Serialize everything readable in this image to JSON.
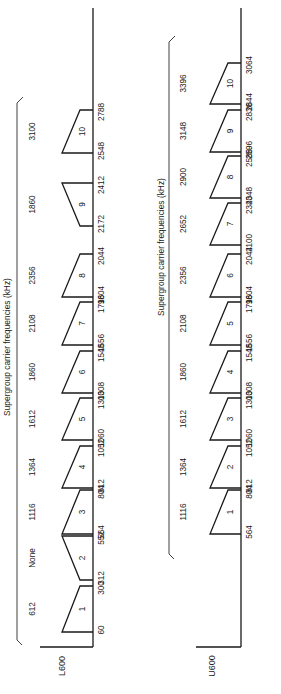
{
  "title": "Supergroup carrier frequencies (kHz)",
  "panels": [
    {
      "name": "L600",
      "label": "L600",
      "title": "Supergroup carrier frequencies (kHz)",
      "supergroups": [
        {
          "n": "1",
          "low": 60,
          "high": 300,
          "carrier": "612",
          "inverted": false
        },
        {
          "n": "2",
          "low": 312,
          "high": 552,
          "carrier": "None",
          "inverted": true
        },
        {
          "n": "3",
          "low": 564,
          "high": 804,
          "carrier": "1116",
          "inverted": false
        },
        {
          "n": "4",
          "low": 812,
          "high": 1052,
          "carrier": "1364",
          "inverted": false
        },
        {
          "n": "5",
          "low": 1060,
          "high": 1300,
          "carrier": "1612",
          "inverted": false
        },
        {
          "n": "6",
          "low": 1308,
          "high": 1548,
          "carrier": "1860",
          "inverted": false
        },
        {
          "n": "7",
          "low": 1556,
          "high": 1796,
          "carrier": "2108",
          "inverted": false
        },
        {
          "n": "8",
          "low": 1804,
          "high": 2044,
          "carrier": "2356",
          "inverted": false
        },
        {
          "n": "9",
          "low": 2172,
          "high": 2412,
          "carrier": "1860",
          "inverted": true
        },
        {
          "n": "10",
          "low": 2548,
          "high": 2788,
          "carrier": "3100",
          "inverted": false
        }
      ]
    },
    {
      "name": "U600",
      "label": "U600",
      "title": "Supergroup carrier frequencies (kHz)",
      "supergroups": [
        {
          "n": "1",
          "low": 564,
          "high": 804,
          "carrier": "1116",
          "inverted": false
        },
        {
          "n": "2",
          "low": 812,
          "high": 1052,
          "carrier": "1364",
          "inverted": false
        },
        {
          "n": "3",
          "low": 1060,
          "high": 1300,
          "carrier": "1612",
          "inverted": false
        },
        {
          "n": "4",
          "low": 1308,
          "high": 1548,
          "carrier": "1860",
          "inverted": false
        },
        {
          "n": "5",
          "low": 1556,
          "high": 1796,
          "carrier": "2108",
          "inverted": false
        },
        {
          "n": "6",
          "low": 1804,
          "high": 2044,
          "carrier": "2356",
          "inverted": false
        },
        {
          "n": "7",
          "low": 2100,
          "high": 2340,
          "carrier": "2652",
          "inverted": false
        },
        {
          "n": "8",
          "low": 2348,
          "high": 2588,
          "carrier": "2900",
          "inverted": false
        },
        {
          "n": "9",
          "low": 2596,
          "high": 2836,
          "carrier": "3148",
          "inverted": false
        },
        {
          "n": "10",
          "low": 2844,
          "high": 3064,
          "carrier": "3396",
          "inverted": false
        }
      ]
    }
  ]
}
